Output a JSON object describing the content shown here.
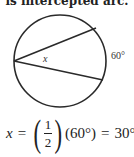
{
  "caption": "is intercepted arc.",
  "diagram": {
    "circle": {
      "cx": 60,
      "cy": 61,
      "r": 46
    },
    "vertex": {
      "x": 14,
      "y": 61
    },
    "chord_endpoints": [
      {
        "x": 96,
        "y": 32
      },
      {
        "x": 103,
        "y": 78
      }
    ],
    "angle_label": "x",
    "arc_label": "60°",
    "stroke_color": "#2a2a2a"
  },
  "formula": {
    "variable": "x",
    "equals": "=",
    "fraction": {
      "numerator": "1",
      "denominator": "2"
    },
    "arc_value": "(60°)",
    "equals2": "=",
    "result": "30°"
  }
}
